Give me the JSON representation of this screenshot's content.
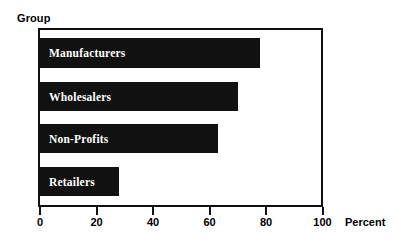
{
  "chart_data": {
    "type": "bar",
    "orientation": "horizontal",
    "title": "",
    "xlabel": "Percent",
    "ylabel": "Group",
    "categories": [
      "Manufacturers",
      "Wholesalers",
      "Non-Profits",
      "Retailers"
    ],
    "values": [
      78,
      70,
      63,
      28
    ],
    "bars": [
      {
        "label": "Manufacturers",
        "value": 78
      },
      {
        "label": "Wholesalers",
        "value": 70
      },
      {
        "label": "Non-Profits",
        "value": 63
      },
      {
        "label": "Retailers",
        "value": 28
      }
    ],
    "xlim": [
      0,
      100
    ],
    "xticks": [
      0,
      20,
      40,
      60,
      80,
      100
    ],
    "xtick_labels": [
      "0",
      "20",
      "40",
      "60",
      "80",
      "100"
    ],
    "grid": false,
    "legend": null,
    "bar_color": "#111111",
    "bar_label_color": "#ffffff",
    "frame_color": "#111111",
    "background_color": "#ffffff"
  },
  "axes": {
    "category_axis_title": "Group",
    "value_axis_title": "Percent"
  }
}
